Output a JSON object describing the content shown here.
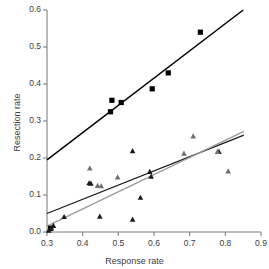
{
  "chart_data": {
    "type": "scatter",
    "title": "",
    "subtitle": "",
    "xlabel": "Response rate",
    "ylabel": "Resection rate",
    "xlim": [
      0.3,
      0.9
    ],
    "ylim": [
      0.0,
      0.6
    ],
    "xticks": [
      "0.3",
      "0.4",
      "0.5",
      "0.6",
      "0.7",
      "0.8",
      "0.9"
    ],
    "xtick_values": [
      0.3,
      0.4,
      0.5,
      0.6,
      0.7,
      0.8,
      0.9
    ],
    "yticks": [
      "0.0",
      "0.1",
      "0.2",
      "0.3",
      "0.4",
      "0.5",
      "0.6"
    ],
    "ytick_values": [
      0.0,
      0.1,
      0.2,
      0.3,
      0.4,
      0.5,
      0.6
    ],
    "grid": false,
    "legend": "none",
    "axis_color": "#808080",
    "series": [
      {
        "name": "squares",
        "marker": "square",
        "color": "#000000",
        "marker_size": 5.2,
        "points": [
          [
            0.31,
            0.01
          ],
          [
            0.478,
            0.325
          ],
          [
            0.482,
            0.356
          ],
          [
            0.508,
            0.35
          ],
          [
            0.595,
            0.387
          ],
          [
            0.64,
            0.43
          ],
          [
            0.73,
            0.54
          ]
        ]
      },
      {
        "name": "triangles-dark",
        "marker": "triangle",
        "color": "#1a1a1a",
        "marker_size": 5.6,
        "points": [
          [
            0.305,
            0.005
          ],
          [
            0.312,
            0.012
          ],
          [
            0.318,
            0.018
          ],
          [
            0.348,
            0.042
          ],
          [
            0.418,
            0.133
          ],
          [
            0.423,
            0.132
          ],
          [
            0.448,
            0.043
          ],
          [
            0.54,
            0.22
          ],
          [
            0.54,
            0.035
          ],
          [
            0.562,
            0.094
          ],
          [
            0.588,
            0.164
          ],
          [
            0.592,
            0.151
          ],
          [
            0.782,
            0.218
          ]
        ]
      },
      {
        "name": "triangles-gray",
        "marker": "triangle",
        "color": "#6f6f6f",
        "marker_size": 5.6,
        "points": [
          [
            0.42,
            0.173
          ],
          [
            0.442,
            0.126
          ],
          [
            0.452,
            0.125
          ],
          [
            0.498,
            0.149
          ],
          [
            0.684,
            0.213
          ],
          [
            0.71,
            0.26
          ],
          [
            0.778,
            0.218
          ],
          [
            0.808,
            0.165
          ]
        ]
      }
    ],
    "fit_lines": [
      {
        "name": "square-fit",
        "color": "#000000",
        "width": 1.5,
        "x0": 0.3,
        "y0": 0.195,
        "x1": 0.85,
        "y1": 0.6
      },
      {
        "name": "triangle-dark-fit",
        "color": "#1a1a1a",
        "width": 1.3,
        "x0": 0.3,
        "y0": 0.05,
        "x1": 0.852,
        "y1": 0.262
      },
      {
        "name": "triangle-gray-fit",
        "color": "#9a9a9a",
        "width": 1.3,
        "x0": 0.3,
        "y0": 0.016,
        "x1": 0.852,
        "y1": 0.272
      }
    ]
  }
}
